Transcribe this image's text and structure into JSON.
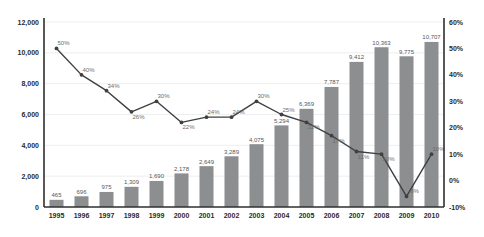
{
  "chart_data": {
    "type": "bar",
    "title": "",
    "subtitle": "",
    "xlabel": "",
    "ylabel": "",
    "y2label": "",
    "grid": true,
    "legend_position": "none",
    "categories": [
      "1995",
      "1996",
      "1997",
      "1998",
      "1999",
      "2000",
      "2001",
      "2002",
      "2003",
      "2004",
      "2005",
      "2006",
      "2007",
      "2008",
      "2009",
      "2010"
    ],
    "ylim": [
      0,
      12000
    ],
    "ytick_labels": [
      "0",
      "2,000",
      "4,000",
      "6,000",
      "8,000",
      "10,000",
      "12,000"
    ],
    "ytick_values": [
      0,
      2000,
      4000,
      6000,
      8000,
      10000,
      12000
    ],
    "y2lim": [
      -10,
      60
    ],
    "y2tick_labels": [
      "-10%",
      "0%",
      "10%",
      "20%",
      "30%",
      "40%",
      "50%",
      "60%"
    ],
    "y2tick_values": [
      -10,
      0,
      10,
      20,
      30,
      40,
      50,
      60
    ],
    "series": [
      {
        "name": "Value",
        "type": "bar",
        "axis": "left",
        "color": "#8c8e90",
        "values": [
          465,
          696,
          975,
          1309,
          1690,
          2178,
          2649,
          3289,
          4075,
          5294,
          6369,
          7787,
          9412,
          10363,
          9775,
          10707
        ],
        "labels": [
          "465",
          "696",
          "975",
          "1,309",
          "1,690",
          "2,178",
          "2,649",
          "3,289",
          "4,075",
          "5,294",
          "6,369",
          "7,787",
          "9,412",
          "10,363",
          "9,775",
          "10,707"
        ]
      },
      {
        "name": "Growth",
        "type": "line",
        "axis": "right",
        "color": "#3f4042",
        "values": [
          50,
          40,
          34,
          26,
          30,
          22,
          24,
          24,
          30,
          25,
          22,
          17,
          11,
          10,
          -6,
          10
        ],
        "labels": [
          "50%",
          "40%",
          "34%",
          "26%",
          "30%",
          "22%",
          "24%",
          "24%",
          "30%",
          "25%",
          "22%",
          "17%",
          "11%",
          "10%",
          "-6%",
          "10%"
        ]
      }
    ]
  }
}
